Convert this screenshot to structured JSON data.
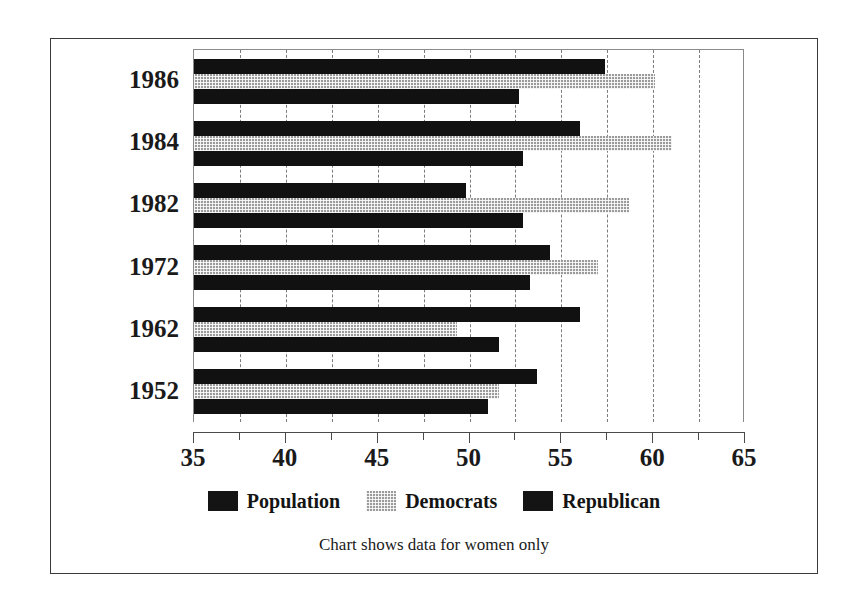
{
  "chart_data": {
    "type": "bar",
    "orientation": "horizontal",
    "title": "",
    "xlabel": "",
    "ylabel": "",
    "xlim": [
      35,
      65
    ],
    "ylim": null,
    "grid": true,
    "grid_axis": "x",
    "legend_position": "bottom",
    "caption": "Chart shows data for women only",
    "categories": [
      "1986",
      "1984",
      "1982",
      "1972",
      "1962",
      "1952"
    ],
    "xticks": [
      35,
      40,
      45,
      50,
      55,
      60,
      65
    ],
    "xtick_labels": [
      "35",
      "40",
      "45",
      "50",
      "55",
      "60",
      "65"
    ],
    "minor_tick_step": 2.5,
    "series": [
      {
        "name": "Population",
        "color": "#141414",
        "values": [
          57.4,
          56.0,
          49.8,
          54.4,
          56.0,
          53.7
        ]
      },
      {
        "name": "Democrats",
        "color": "#9b9b9b",
        "values": [
          60.1,
          61.0,
          58.7,
          57.0,
          49.3,
          51.6
        ]
      },
      {
        "name": "Republican",
        "color": "#141414",
        "values": [
          52.7,
          52.9,
          52.9,
          53.3,
          51.6,
          51.0
        ]
      }
    ]
  },
  "legend": {
    "items": [
      {
        "label": "Population",
        "swatch": "population"
      },
      {
        "label": "Democrats",
        "swatch": "democrats"
      },
      {
        "label": "Republican",
        "swatch": "republican"
      }
    ]
  },
  "caption": "Chart shows data for women only"
}
